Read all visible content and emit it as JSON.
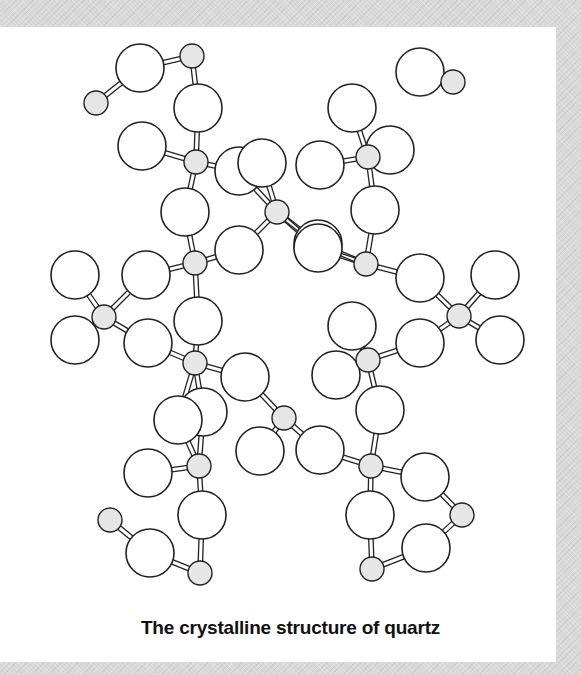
{
  "figure": {
    "caption": "The crystalline structure of quartz",
    "colors": {
      "background": "#d9d9d9",
      "panel": "#ffffff",
      "oxygen_fill": "#ffffff",
      "silicon_fill": "#e6e6e6",
      "stroke": "#222222"
    },
    "legend_semantics": {
      "large_circles": "oxygen atoms",
      "small_shaded_circles": "silicon atoms"
    },
    "silicon_atoms": [
      [
        192,
        56
      ],
      [
        453,
        82
      ],
      [
        96,
        103
      ],
      [
        196,
        162
      ],
      [
        368,
        157
      ],
      [
        277,
        212
      ],
      [
        195,
        263
      ],
      [
        366,
        264
      ],
      [
        104,
        317
      ],
      [
        459,
        316
      ],
      [
        195,
        363
      ],
      [
        368,
        360
      ],
      [
        284,
        418
      ],
      [
        199,
        466
      ],
      [
        371,
        466
      ],
      [
        110,
        520
      ],
      [
        462,
        515
      ],
      [
        200,
        573
      ],
      [
        372,
        569
      ]
    ],
    "oxygen_atoms": [
      [
        140,
        68
      ],
      [
        198,
        108
      ],
      [
        142,
        146
      ],
      [
        239,
        171
      ],
      [
        185,
        212
      ],
      [
        239,
        250
      ],
      [
        146,
        275
      ],
      [
        198,
        321
      ],
      [
        75,
        275
      ],
      [
        75,
        340
      ],
      [
        148,
        343
      ],
      [
        203,
        412
      ],
      [
        245,
        377
      ],
      [
        260,
        451
      ],
      [
        178,
        420
      ],
      [
        202,
        515
      ],
      [
        148,
        473
      ],
      [
        150,
        553
      ],
      [
        420,
        72
      ],
      [
        352,
        108
      ],
      [
        390,
        150
      ],
      [
        320,
        165
      ],
      [
        318,
        244
      ],
      [
        375,
        210
      ],
      [
        318,
        248
      ],
      [
        352,
        326
      ],
      [
        420,
        278
      ],
      [
        495,
        275
      ],
      [
        500,
        340
      ],
      [
        420,
        343
      ],
      [
        380,
        410
      ],
      [
        336,
        375
      ],
      [
        320,
        450
      ],
      [
        370,
        515
      ],
      [
        425,
        477
      ],
      [
        426,
        548
      ],
      [
        262,
        163
      ]
    ]
  }
}
